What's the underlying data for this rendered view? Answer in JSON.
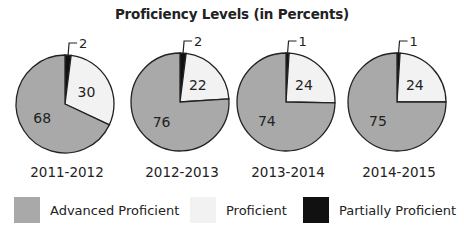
{
  "chart_data": {
    "type": "pie",
    "title": "Proficiency Levels (in Percents)",
    "categories": [
      "2011-2012",
      "2012-2013",
      "2013-2014",
      "2014-2015"
    ],
    "series": [
      {
        "name": "Partially Proficient",
        "color": "#111111",
        "values": [
          2,
          2,
          1,
          1
        ]
      },
      {
        "name": "Proficient",
        "color": "#f2f2f2",
        "values": [
          30,
          22,
          24,
          24
        ]
      },
      {
        "name": "Advanced Proficient",
        "color": "#a9a9a9",
        "values": [
          68,
          76,
          74,
          75
        ]
      }
    ],
    "pies": [
      {
        "label": "2011-2012",
        "slices": {
          "Partially Proficient": 2,
          "Proficient": 30,
          "Advanced Proficient": 68
        }
      },
      {
        "label": "2012-2013",
        "slices": {
          "Partially Proficient": 2,
          "Proficient": 22,
          "Advanced Proficient": 76
        }
      },
      {
        "label": "2013-2014",
        "slices": {
          "Partially Proficient": 1,
          "Proficient": 24,
          "Advanced Proficient": 74
        }
      },
      {
        "label": "2014-2015",
        "slices": {
          "Partially Proficient": 1,
          "Proficient": 24,
          "Advanced Proficient": 75
        }
      }
    ],
    "legend": {
      "position": "bottom",
      "entries": [
        "Advanced Proficient",
        "Proficient",
        "Partially Proficient"
      ]
    },
    "slice_order": "clockwise from 12 o'clock: Partially Proficient, Proficient, Advanced Proficient",
    "grid": false
  },
  "header": {
    "title": "Proficiency Levels (in Percents)"
  },
  "legend": {
    "items": [
      {
        "label": "Advanced Proficient",
        "color": "#a9a9a9"
      },
      {
        "label": "Proficient",
        "color": "#f2f2f2"
      },
      {
        "label": "Partially Proficient",
        "color": "#111111"
      }
    ]
  },
  "layout": {
    "pies": [
      {
        "cx": 65,
        "cy": 104,
        "r": 49,
        "label_y": 172
      },
      {
        "cx": 180,
        "cy": 102,
        "r": 49,
        "label_y": 172
      },
      {
        "cx": 286,
        "cy": 102,
        "r": 49,
        "label_y": 172
      },
      {
        "cx": 397,
        "cy": 102,
        "r": 49,
        "label_y": 172
      }
    ]
  }
}
